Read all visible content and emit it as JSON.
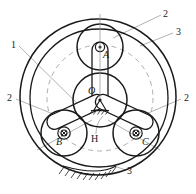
{
  "figure": {
    "type": "planetary-gear-train-schematic",
    "title": "",
    "stroke_color": "#1a1a1a",
    "leader_color": "#8a8a8a",
    "dash_color": "#9a9a9a",
    "background": "#ffffff",
    "width": 196,
    "height": 194
  },
  "geometry": {
    "ring_center": {
      "x": 98,
      "y": 97
    },
    "ring_outer_r": 78,
    "ring_inner_r": 70,
    "sun_center": {
      "x": 100,
      "y": 100
    },
    "sun_r": 27,
    "planet_r": 23,
    "pitch_circle_r": 53,
    "planets": [
      {
        "label": "A",
        "x": 100,
        "y": 47,
        "pin": "dot"
      },
      {
        "label": "B",
        "x": 64,
        "y": 133,
        "pin": "cross"
      },
      {
        "label": "C",
        "x": 136,
        "y": 133,
        "pin": "cross"
      }
    ]
  },
  "labels": {
    "center": "O",
    "planet_a": "A",
    "planet_b": "B",
    "planet_c": "C",
    "carrier": "H",
    "sun_gear": "1",
    "planet_gear_top": "2",
    "planet_gear_left": "2",
    "planet_gear_right": "2",
    "ring_gear_top": "3",
    "ring_gear_bottom": "3"
  },
  "label_positions": {
    "center": {
      "x": 88,
      "y": 92
    },
    "planet_a": {
      "x": 103,
      "y": 52
    },
    "planet_b": {
      "x": 57,
      "y": 138
    },
    "planet_c": {
      "x": 142,
      "y": 138
    },
    "carrier": {
      "x": 92,
      "y": 138
    },
    "sun_gear": {
      "x": 11,
      "y": 44
    },
    "planet_gear_top": {
      "x": 163,
      "y": 13
    },
    "planet_gear_left": {
      "x": 8,
      "y": 97
    },
    "planet_gear_right": {
      "x": 184,
      "y": 97
    },
    "ring_gear_top": {
      "x": 175,
      "y": 31
    },
    "ring_gear_bottom": {
      "x": 127,
      "y": 172
    }
  }
}
